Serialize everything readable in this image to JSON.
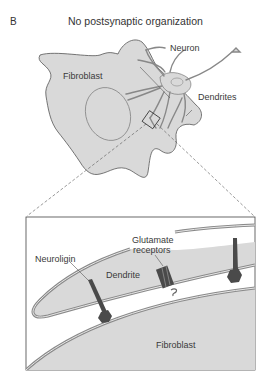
{
  "panel": {
    "letter": "B",
    "title": "No postsynaptic organization"
  },
  "overview": {
    "labels": {
      "neuron": "Neuron",
      "fibroblast": "Fibroblast",
      "dendrites": "Dendrites"
    }
  },
  "inset": {
    "labels": {
      "neuroligin": "Neuroligin",
      "glutamate_receptors_line1": "Glutamate",
      "glutamate_receptors_line2": "receptors",
      "dendrite": "Dendrite",
      "fibroblast": "Fibroblast"
    }
  },
  "colors": {
    "cell_fill": "#d9d9d9",
    "cell_outline": "#555555",
    "membrane": "#8a8a8a",
    "protein_dark": "#4a4a4a",
    "background": "#ffffff"
  }
}
